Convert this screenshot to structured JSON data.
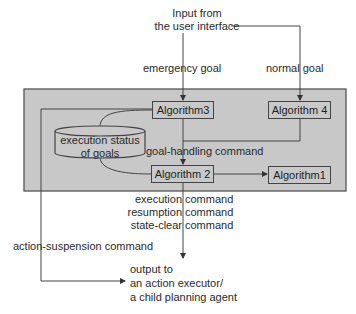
{
  "diagram": {
    "input_label_line1": "Input from",
    "input_label_line2": "the user interface",
    "emergency_goal": "emergency goal",
    "normal_goal": "normal goal",
    "goal_handling_command": "goal-handling command",
    "database_line1": "execution status",
    "database_line2": "of goals",
    "nodes": {
      "algorithm3": "Algorithm3",
      "algorithm4": "Algorithm 4",
      "algorithm2": "Algorithm 2",
      "algorithm1": "Algorithm1"
    },
    "commands_left": [
      "execution",
      "resumption",
      "state-clear"
    ],
    "commands_right": [
      "command",
      "command",
      "command"
    ],
    "action_suspension_command": "action-suspension command",
    "output_line1": "output to",
    "output_line2": "an action executor/",
    "output_line3": "a child planning agent",
    "colors": {
      "container_fill": "#c8c8c8",
      "box_fill": "#c9c9c9",
      "line": "#444444"
    }
  }
}
